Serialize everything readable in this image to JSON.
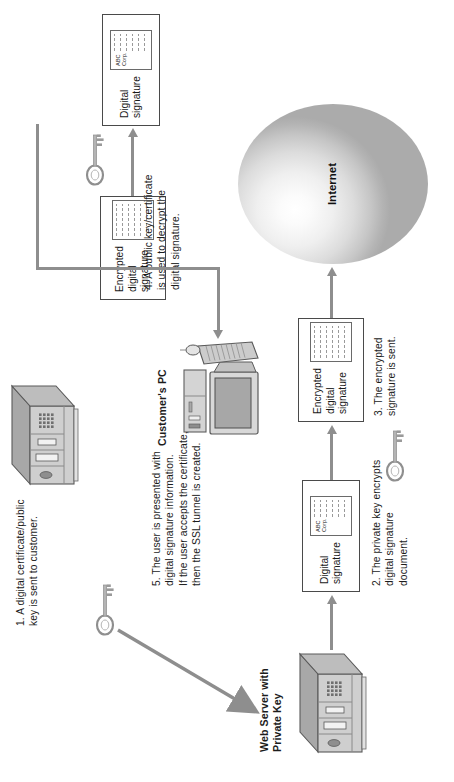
{
  "diagram": {
    "orientation": "rotated-90-ccw",
    "colors": {
      "connector": "#8e8e8e",
      "box_border": "#4a4a4a",
      "text": "#1a1a1a",
      "cloud_fill": "#dcdcdc",
      "server_body": "#c9c9c9",
      "server_top": "#9e9e9e"
    }
  },
  "labels": {
    "customer_pc": "Customer's PC",
    "web_server": "Web Server with\nPrivate Key",
    "internet": "Internet"
  },
  "boxes": {
    "digital_signature_server": {
      "label": "Digital\nsignature",
      "doc_text": "ABC\nCorp."
    },
    "encrypted_signature_out": {
      "label": "Encrypted\ndigital\nsignature",
      "doc_text": ""
    },
    "encrypted_signature_in": {
      "label": "Encrypted\ndigital\nsignature",
      "doc_text": ""
    },
    "digital_signature_client": {
      "label": "Digital\nsignature",
      "doc_text": "ABC\nCorp."
    }
  },
  "steps": [
    {
      "id": 1,
      "text": "1. A digital certificate/public\n     key is sent to customer."
    },
    {
      "id": 2,
      "text": "2. The private key encrypts\n     digital signature\n     document."
    },
    {
      "id": 3,
      "text": "3. The encrypted\n     signature is sent."
    },
    {
      "id": 4,
      "text": "4. A public key/certificate\n     is used to decrypt the\n     digital signature."
    },
    {
      "id": 5,
      "text": "5. The user is presented with\n     digital signature information.\n     If the user accepts the certificate,\n     then the SSL tunnel is created."
    }
  ],
  "icons": {
    "key_public": "key-icon",
    "key_private": "key-icon",
    "key_decrypt": "key-icon",
    "server_top": "server-icon",
    "server_bottom": "server-icon",
    "desktop_pc": "desktop-computer-icon",
    "cloud": "internet-cloud-icon"
  }
}
